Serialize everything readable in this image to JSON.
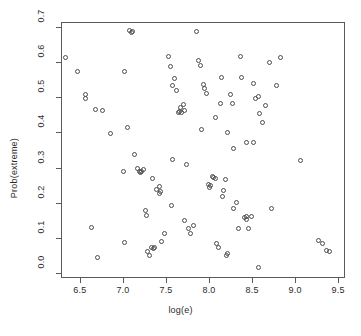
{
  "chart_data": {
    "type": "scatter",
    "title": "",
    "xlabel": "log(e)",
    "ylabel": "Prob(extreme)",
    "xlim": [
      6.28,
      9.58
    ],
    "ylim": [
      -0.015,
      0.715
    ],
    "xticks": [
      6.5,
      7.0,
      7.5,
      8.0,
      8.5,
      9.0,
      9.5
    ],
    "xtick_labels": [
      "6.5",
      "7.0",
      "7.5",
      "8.0",
      "8.5",
      "9.0",
      "9.5"
    ],
    "yticks": [
      0.0,
      0.1,
      0.2,
      0.3,
      0.4,
      0.5,
      0.6,
      0.7
    ],
    "ytick_labels": [
      "0.0",
      "0.1",
      "0.2",
      "0.3",
      "0.4",
      "0.5",
      "0.6",
      "0.7"
    ],
    "grid": false,
    "legend": null,
    "marker": "open-circle",
    "marker_color": "#4d4d4d",
    "point_count": 108,
    "points": [
      [
        6.33,
        0.615
      ],
      [
        6.47,
        0.573
      ],
      [
        6.56,
        0.497
      ],
      [
        6.57,
        0.508
      ],
      [
        6.64,
        0.128
      ],
      [
        6.68,
        0.465
      ],
      [
        6.7,
        0.043
      ],
      [
        6.85,
        0.397
      ],
      [
        7.02,
        0.573
      ],
      [
        7.02,
        0.085
      ],
      [
        7.05,
        0.414
      ],
      [
        7.08,
        0.69
      ],
      [
        7.1,
        0.684
      ],
      [
        7.11,
        0.687
      ],
      [
        7.13,
        0.338
      ],
      [
        7.17,
        0.298
      ],
      [
        7.19,
        0.288
      ],
      [
        7.2,
        0.287
      ],
      [
        7.21,
        0.29
      ],
      [
        7.24,
        0.294
      ],
      [
        7.26,
        0.178
      ],
      [
        7.27,
        0.163
      ],
      [
        7.29,
        0.062
      ],
      [
        7.31,
        0.048
      ],
      [
        7.33,
        0.072
      ],
      [
        7.35,
        0.07
      ],
      [
        7.37,
        0.073
      ],
      [
        7.39,
        0.237
      ],
      [
        7.42,
        0.227
      ],
      [
        7.43,
        0.245
      ],
      [
        7.44,
        0.232
      ],
      [
        7.45,
        0.09
      ],
      [
        7.48,
        0.113
      ],
      [
        7.53,
        0.618
      ],
      [
        7.55,
        0.588
      ],
      [
        7.57,
        0.322
      ],
      [
        7.58,
        0.534
      ],
      [
        7.6,
        0.553
      ],
      [
        7.62,
        0.521
      ],
      [
        7.64,
        0.457
      ],
      [
        7.66,
        0.461
      ],
      [
        7.67,
        0.47
      ],
      [
        7.68,
        0.458
      ],
      [
        7.7,
        0.481
      ],
      [
        7.72,
        0.463
      ],
      [
        7.74,
        0.31
      ],
      [
        7.76,
        0.126
      ],
      [
        7.79,
        0.112
      ],
      [
        7.82,
        0.134
      ],
      [
        7.85,
        0.688
      ],
      [
        7.88,
        0.604
      ],
      [
        7.9,
        0.592
      ],
      [
        7.93,
        0.536
      ],
      [
        7.95,
        0.524
      ],
      [
        7.97,
        0.512
      ],
      [
        7.99,
        0.252
      ],
      [
        8.0,
        0.243
      ],
      [
        8.02,
        0.248
      ],
      [
        8.04,
        0.275
      ],
      [
        8.05,
        0.272
      ],
      [
        8.07,
        0.27
      ],
      [
        8.09,
        0.083
      ],
      [
        8.11,
        0.072
      ],
      [
        8.13,
        0.482
      ],
      [
        8.14,
        0.557
      ],
      [
        8.16,
        0.217
      ],
      [
        8.17,
        0.235
      ],
      [
        8.19,
        0.265
      ],
      [
        8.2,
        0.048
      ],
      [
        8.22,
        0.054
      ],
      [
        8.25,
        0.508
      ],
      [
        8.27,
        0.483
      ],
      [
        8.29,
        0.183
      ],
      [
        8.32,
        0.201
      ],
      [
        8.34,
        0.126
      ],
      [
        8.36,
        0.616
      ],
      [
        8.38,
        0.558
      ],
      [
        8.41,
        0.157
      ],
      [
        8.43,
        0.16
      ],
      [
        8.44,
        0.152
      ],
      [
        8.46,
        0.126
      ],
      [
        8.49,
        0.16
      ],
      [
        8.52,
        0.54
      ],
      [
        8.54,
        0.497
      ],
      [
        8.57,
        0.502
      ],
      [
        8.58,
        0.014
      ],
      [
        8.62,
        0.428
      ],
      [
        8.66,
        0.478
      ],
      [
        8.7,
        0.6
      ],
      [
        8.73,
        0.183
      ],
      [
        8.78,
        0.534
      ],
      [
        8.83,
        0.614
      ],
      [
        9.06,
        0.32
      ],
      [
        9.27,
        0.092
      ],
      [
        9.32,
        0.082
      ],
      [
        9.36,
        0.064
      ],
      [
        9.4,
        0.062
      ],
      [
        6.76,
        0.462
      ],
      [
        7.01,
        0.288
      ],
      [
        7.56,
        0.193
      ],
      [
        7.71,
        0.148
      ],
      [
        7.91,
        0.408
      ],
      [
        8.07,
        0.443
      ],
      [
        8.21,
        0.401
      ],
      [
        8.29,
        0.355
      ],
      [
        8.44,
        0.37
      ],
      [
        8.52,
        0.372
      ],
      [
        8.59,
        0.455
      ],
      [
        7.34,
        0.268
      ]
    ]
  }
}
